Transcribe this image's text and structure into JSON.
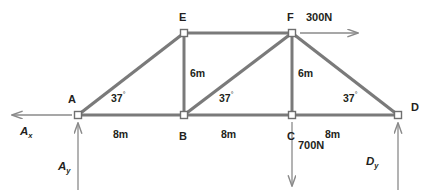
{
  "diagram": {
    "colors": {
      "member": "#7a7a7a",
      "node_fill": "#ffffff",
      "node_stroke": "#6f6f6f",
      "arrow": "#8a8a8a",
      "text": "#231f20",
      "background": "#ffffff"
    },
    "nodes": [
      {
        "id": "A",
        "label": "A",
        "x": 78,
        "y": 115,
        "label_x": 68,
        "label_y": 94
      },
      {
        "id": "B",
        "label": "B",
        "x": 184,
        "y": 115,
        "label_x": 179,
        "label_y": 131
      },
      {
        "id": "C",
        "label": "C",
        "x": 292,
        "y": 115,
        "label_x": 287,
        "label_y": 131
      },
      {
        "id": "D",
        "label": "D",
        "x": 398,
        "y": 115,
        "label_x": 411,
        "label_y": 102
      },
      {
        "id": "E",
        "label": "E",
        "x": 184,
        "y": 33,
        "label_x": 179,
        "label_y": 12
      },
      {
        "id": "F",
        "label": "F",
        "x": 292,
        "y": 33,
        "label_x": 287,
        "label_y": 12
      }
    ],
    "members": [
      {
        "name": "member-A-E",
        "from": "A",
        "to": "E"
      },
      {
        "name": "member-E-F",
        "from": "E",
        "to": "F"
      },
      {
        "name": "member-E-B",
        "from": "E",
        "to": "B"
      },
      {
        "name": "member-B-F",
        "from": "B",
        "to": "F"
      },
      {
        "name": "member-F-C",
        "from": "F",
        "to": "C"
      },
      {
        "name": "member-F-D",
        "from": "F",
        "to": "D"
      },
      {
        "name": "member-A-B",
        "from": "A",
        "to": "B"
      },
      {
        "name": "member-B-C",
        "from": "B",
        "to": "C"
      },
      {
        "name": "member-C-D",
        "from": "C",
        "to": "D"
      }
    ],
    "dimensions": [
      {
        "name": "span-A-B",
        "text": "8m",
        "x": 122,
        "y": 129
      },
      {
        "name": "span-B-C",
        "text": "8m",
        "x": 230,
        "y": 129
      },
      {
        "name": "span-C-D",
        "text": "8m",
        "x": 334,
        "y": 129
      },
      {
        "name": "height-E-B",
        "text": "6m",
        "x": 190,
        "y": 68
      },
      {
        "name": "height-F-C",
        "text": "6m",
        "x": 298,
        "y": 68
      }
    ],
    "angles": [
      {
        "name": "angle-at-A",
        "value": "37",
        "degree": "°",
        "x": 114,
        "y": 91
      },
      {
        "name": "angle-at-B",
        "value": "37",
        "degree": "°",
        "x": 222,
        "y": 91
      },
      {
        "name": "angle-at-D",
        "value": "37",
        "degree": "°",
        "x": 346,
        "y": 91
      }
    ],
    "loads": [
      {
        "name": "load-300N-at-F",
        "label": "300N",
        "label_x": 308,
        "label_y": 12,
        "direction": "right",
        "from_x": 300,
        "from_y": 33,
        "to_x": 360,
        "to_y": 33
      },
      {
        "name": "load-700N-at-C",
        "label": "700N",
        "label_x": 300,
        "label_y": 141,
        "direction": "down",
        "from_x": 292,
        "from_y": 122,
        "to_x": 292,
        "to_y": 188
      }
    ],
    "reactions": [
      {
        "name": "reaction-Ax",
        "symbol": "A",
        "subscript": "x",
        "label_x": 20,
        "label_y": 128,
        "direction": "left",
        "from_x": 72,
        "from_y": 115,
        "to_x": 10,
        "to_y": 115
      },
      {
        "name": "reaction-Ay",
        "symbol": "A",
        "subscript": "y",
        "label_x": 60,
        "label_y": 163,
        "direction": "up",
        "from_x": 78,
        "from_y": 190,
        "to_x": 78,
        "to_y": 121
      },
      {
        "name": "reaction-Dy",
        "symbol": "D",
        "subscript": "y",
        "label_x": 368,
        "label_y": 158,
        "direction": "up",
        "from_x": 398,
        "from_y": 190,
        "to_x": 398,
        "to_y": 121
      }
    ]
  }
}
